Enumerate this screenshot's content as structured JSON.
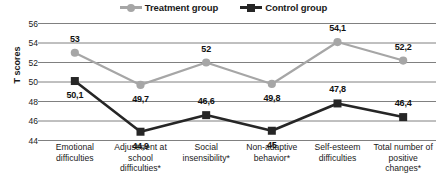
{
  "chart_data": {
    "type": "line",
    "title": "",
    "xlabel": "",
    "ylabel": "T scores",
    "ylim": [
      44,
      56
    ],
    "ytick_step": 2,
    "yticks": [
      "56",
      "54",
      "52",
      "50",
      "48",
      "46",
      "44"
    ],
    "grid": true,
    "legend_position": "top-center",
    "categories": [
      "Emotional difficulties",
      "Adjustment at school difficulties*",
      "Social insensibility*",
      "Non-adaptive behavior*",
      "Self-esteem difficulties",
      "Total number of positive changes*"
    ],
    "category_lines": [
      [
        "Emotional",
        "difficulties"
      ],
      [
        "Adjustment at",
        "school",
        "difficulties*"
      ],
      [
        "Social",
        "insensibility*"
      ],
      [
        "Non-adaptive",
        "behavior*"
      ],
      [
        "Self-esteem",
        "difficulties"
      ],
      [
        "Total number of",
        "positive",
        "changes*"
      ]
    ],
    "series": [
      {
        "name": "Treatment group",
        "marker": "circle",
        "color": "#a6a6a6",
        "values": [
          53,
          49.7,
          52,
          49.8,
          54.1,
          52.2
        ],
        "labels": [
          "53",
          "49,7",
          "52",
          "49,8",
          "54,1",
          "52,2"
        ]
      },
      {
        "name": "Control group",
        "marker": "square",
        "color": "#262626",
        "values": [
          50.1,
          44.9,
          46.6,
          45,
          47.8,
          46.4
        ],
        "labels": [
          "50,1",
          "44,9",
          "46,6",
          "45",
          "47,8",
          "46,4"
        ]
      }
    ]
  },
  "legend": {
    "items": [
      {
        "label": "Treatment group",
        "marker": "circle-marker",
        "color": "#a6a6a6"
      },
      {
        "label": "Control group",
        "marker": "square-marker",
        "color": "#262626"
      }
    ]
  },
  "axis": {
    "y_title": "T scores"
  },
  "colors": {
    "treatment": "#a6a6a6",
    "control": "#262626",
    "grid": "#808080",
    "text": "#1a1a1a",
    "background": "#ffffff"
  }
}
